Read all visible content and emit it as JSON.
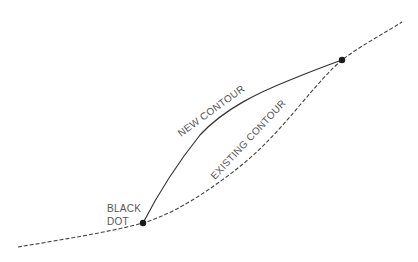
{
  "diagram": {
    "labels": {
      "new_contour": "NEW CONTOUR",
      "existing_contour": "EXISTING CONTOUR",
      "black_dot_line1": "BLACK",
      "black_dot_line2": "DOT"
    },
    "colors": {
      "background": "#ffffff",
      "line": "#333333",
      "text": "#555555",
      "dot": "#1a1a1a"
    },
    "elements": {
      "existing_contour_style": "dashed",
      "new_contour_style": "solid",
      "dot_count": 2
    }
  }
}
